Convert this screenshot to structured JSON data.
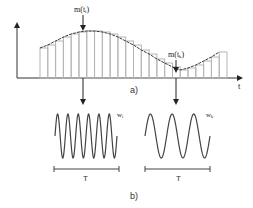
{
  "panel_a": {
    "label": "a)",
    "x_axis_label": "t",
    "marker_left": "m(tⱼ)",
    "marker_left_main": "m(t",
    "marker_left_sub": "i",
    "marker_right_main": "m(t",
    "marker_right_sub": "k",
    "bar_count": 24,
    "bar_heights": [
      30,
      33,
      37,
      41,
      44,
      46,
      47,
      47,
      46,
      44,
      41,
      37,
      33,
      28,
      24,
      19,
      15,
      11,
      8,
      10,
      13,
      17,
      21,
      26
    ]
  },
  "panel_b": {
    "label": "b)",
    "left_wave": {
      "label_main": "w",
      "label_sub": "i",
      "period_label": "T",
      "cycles": 6
    },
    "right_wave": {
      "label_main": "w",
      "label_sub": "k",
      "period_label": "T",
      "cycles": 3
    }
  },
  "colors": {
    "line": "#3a3a3a",
    "bars": "#b5b5b5",
    "axis": "#333333"
  }
}
